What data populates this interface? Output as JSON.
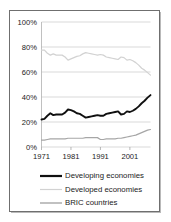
{
  "figure": {
    "frame_color": "#6f6f6f",
    "background": "#ffffff"
  },
  "chart_data": {
    "type": "line",
    "title": "",
    "subtitle": "",
    "xlabel": "",
    "ylabel": "",
    "xlim": [
      1971,
      2008
    ],
    "ylim": [
      0,
      100
    ],
    "grid": true,
    "grid_axis": "y",
    "legend_position": "bottom",
    "y_ticks": [
      0,
      20,
      40,
      60,
      80,
      100
    ],
    "y_tick_labels": [
      "0%",
      "20%",
      "40%",
      "60%",
      "80%",
      "100%"
    ],
    "x_ticks": [
      1971,
      1981,
      1991,
      2001
    ],
    "x_tick_labels": [
      "1971",
      "1981",
      "1991",
      "2001"
    ],
    "x": [
      1971,
      1972,
      1973,
      1974,
      1975,
      1976,
      1977,
      1978,
      1979,
      1980,
      1981,
      1982,
      1983,
      1984,
      1985,
      1986,
      1987,
      1988,
      1989,
      1990,
      1991,
      1992,
      1993,
      1994,
      1995,
      1996,
      1997,
      1998,
      1999,
      2000,
      2001,
      2002,
      2003,
      2004,
      2005,
      2006,
      2007,
      2008
    ],
    "series": [
      {
        "name": "Developing economies",
        "color": "#101010",
        "width": 1.9,
        "values": [
          22,
          22.5,
          25,
          27,
          25.5,
          26,
          26,
          26,
          27.5,
          30,
          29.5,
          28.5,
          27,
          26.5,
          25,
          23.5,
          24,
          24.5,
          25,
          25.5,
          25,
          25,
          26.5,
          27,
          27.5,
          28,
          28.5,
          26,
          26.5,
          28.5,
          28,
          29,
          30.5,
          32.5,
          35,
          37,
          39.5,
          41.5
        ]
      },
      {
        "name": "Developed economies",
        "color": "#d2d2d2",
        "width": 1.2,
        "values": [
          77.5,
          77.5,
          75,
          73.5,
          74.5,
          73.5,
          73.5,
          73.5,
          72,
          69.5,
          70.5,
          71.5,
          72.5,
          73,
          74.5,
          75.5,
          75,
          74.5,
          74,
          73.5,
          74,
          73.5,
          72,
          71.5,
          71,
          70.5,
          70,
          72,
          71.5,
          69.5,
          70,
          69,
          67.5,
          65.5,
          63,
          61.5,
          59.5,
          57.5
        ]
      },
      {
        "name": "BRIC countries",
        "color": "#a6a6a6",
        "width": 1.2,
        "values": [
          5.5,
          5.5,
          6,
          6.5,
          6.5,
          6.5,
          6.5,
          6.5,
          6.5,
          7,
          7,
          7,
          7,
          7,
          7,
          7.5,
          7.5,
          7.5,
          7.5,
          7.5,
          6,
          6,
          6.5,
          6.5,
          6.5,
          6.5,
          7,
          7,
          7.5,
          8,
          8.5,
          9,
          9.5,
          10.5,
          11.5,
          12.5,
          13.5,
          14
        ]
      }
    ],
    "legend": [
      {
        "label": "Developing economies",
        "color": "#101010",
        "width": 2.2
      },
      {
        "label": "Developed economies",
        "color": "#d2d2d2",
        "width": 1.2
      },
      {
        "label": "BRIC countries",
        "color": "#a6a6a6",
        "width": 1.4
      }
    ]
  }
}
